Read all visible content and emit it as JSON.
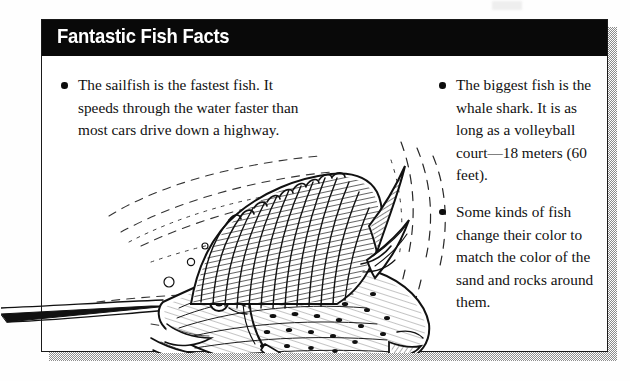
{
  "page": {
    "background_color": "#ffffff",
    "text_color": "#111111"
  },
  "factbox": {
    "header": {
      "title": "Fantastic Fish Facts",
      "background_color": "#090909",
      "text_color": "#ffffff"
    },
    "border_color": "#1a1a1a",
    "shadow_color": "#8d8d8d",
    "columns": [
      {
        "id": "left",
        "facts": [
          {
            "bullet": "•",
            "text": "The sailfish is the fastest fish. It speeds through the water faster than most cars drive down a highway."
          }
        ]
      },
      {
        "id": "right",
        "facts": [
          {
            "bullet": "•",
            "text": "The biggest fish is the whale shark. It is as long as a volleyball court—18 meters (60 feet)."
          },
          {
            "bullet": "•",
            "text": "Some kinds of fish change their color to match the color of the sand and rocks around them."
          }
        ]
      }
    ]
  },
  "illustration": {
    "name": "sailfish-line-drawing",
    "description": "Black and white pen-and-ink line drawing of a sailfish with a long pointed bill, large spiny dorsal sail, spotted body and forked tail, surrounded by dashed water motion lines and bubbles.",
    "ink_color": "#111111"
  }
}
